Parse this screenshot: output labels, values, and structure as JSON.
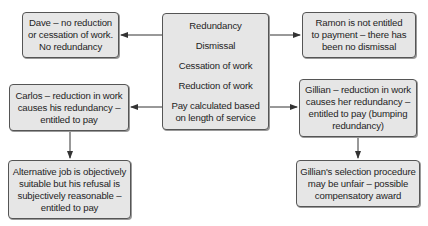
{
  "diagram": {
    "center": {
      "items": [
        "Redundancy",
        "Dismissal",
        "Cessation of work",
        "Reduction of work",
        "Pay calculated based on length of service"
      ],
      "lines": {
        "item5_line1": "Pay calculated based",
        "item5_line2": "on length of service"
      }
    },
    "dave": {
      "line1": "Dave – no reduction",
      "line2": "or cessation of work.",
      "line3": "No redundancy"
    },
    "ramon": {
      "line1": "Ramon is not entitled",
      "line2": "to payment – there has",
      "line3": "been no dismissal"
    },
    "carlos": {
      "line1": "Carlos – reduction in work",
      "line2": "causes his redundancy –",
      "line3": "entitled to pay"
    },
    "alternative_job": {
      "line1": "Alternative job is objectively",
      "line2": "suitable but his refusal is",
      "line3": "subjectively reasonable –",
      "line4": "entitled to pay"
    },
    "gillian": {
      "line1": "Gillian – reduction in work",
      "line2": "causes her redundancy –",
      "line3": "entitled to pay (bumping",
      "line4": "redundancy)"
    },
    "gillian_selection": {
      "line1": "Gillian's selection procedure",
      "line2": "may be unfair – possible",
      "line3": "compensatory award"
    },
    "edges": [
      {
        "from": "center",
        "to": "dave"
      },
      {
        "from": "center",
        "to": "ramon"
      },
      {
        "from": "center",
        "to": "carlos"
      },
      {
        "from": "center",
        "to": "gillian"
      },
      {
        "from": "carlos",
        "to": "alternative_job"
      },
      {
        "from": "gillian",
        "to": "gillian_selection"
      }
    ],
    "colors": {
      "box_fill": "#e6e6e6",
      "box_border": "#555555",
      "line": "#333333",
      "text": "#1e1e1e"
    }
  }
}
